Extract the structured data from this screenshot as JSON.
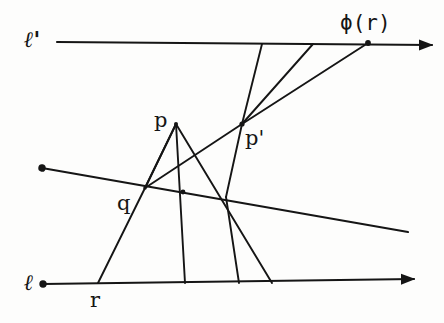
{
  "figure": {
    "background_color": "#fdfdfc",
    "ink_color": "#151515",
    "labels": {
      "line_l_prime": "ℓ'",
      "line_l": "ℓ",
      "point_p": "p",
      "point_p_prime": "p'",
      "point_q": "q",
      "point_r": "r",
      "point_phi_r": "ϕ(r)"
    },
    "points": {
      "p": {
        "x": 176,
        "y": 124
      },
      "p_prime": {
        "x": 242,
        "y": 124
      },
      "q": {
        "x": 145,
        "y": 188
      },
      "r": {
        "x": 98,
        "y": 283
      },
      "phi_r": {
        "x": 368,
        "y": 43
      },
      "a_top": {
        "x": 262,
        "y": 44
      },
      "b_top": {
        "x": 313,
        "y": 44
      },
      "foot_mid": {
        "x": 185,
        "y": 283
      },
      "foot_right": {
        "x": 272,
        "y": 283
      },
      "cross_mid": {
        "x": 183,
        "y": 192
      },
      "cross_right": {
        "x": 228,
        "y": 198
      }
    },
    "lines": {
      "l_prime": {
        "x1": 57,
        "y1": 42,
        "x2": 432,
        "y2": 45,
        "arrow": "right-end"
      },
      "l": {
        "x1": 43,
        "y1": 284,
        "x2": 414,
        "y2": 279,
        "arrow": "both-ends"
      },
      "oblique": {
        "x1": 42,
        "y1": 168,
        "x2": 408,
        "y2": 232,
        "arrow": "none"
      }
    },
    "segments": [
      {
        "name": "p-to-q-side",
        "from": "p",
        "to": "q"
      },
      {
        "name": "q-to-r",
        "from": "q",
        "to": "r"
      },
      {
        "name": "p-to-foot-mid",
        "from": "p",
        "to": "foot_mid"
      },
      {
        "name": "p-to-foot-right",
        "from": "p",
        "to": "foot_right"
      },
      {
        "name": "pprime-to-foot-right",
        "from": "p_prime",
        "to": "foot_right"
      },
      {
        "name": "pprime-to-q",
        "from": "p_prime",
        "to": "q"
      },
      {
        "name": "pprime-to-a-top",
        "from": "p_prime",
        "to": "a_top"
      },
      {
        "name": "pprime-to-b-top",
        "from": "p_prime",
        "to": "b_top"
      },
      {
        "name": "pprime-to-phi-r",
        "from": "p_prime",
        "to": "phi_r"
      }
    ]
  }
}
